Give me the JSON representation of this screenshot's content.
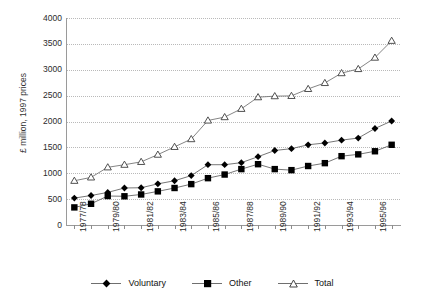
{
  "chart_data": {
    "type": "line",
    "title": "",
    "xlabel": "",
    "ylabel": "£ million, 1997 prices",
    "ylim": [
      0,
      4000
    ],
    "yticks": [
      0,
      500,
      1000,
      1500,
      2000,
      2500,
      3000,
      3500,
      4000
    ],
    "grid": true,
    "legend_position": "bottom",
    "x": [
      "1977/78",
      "1978/79",
      "1979/80",
      "1980/81",
      "1981/82",
      "1982/83",
      "1983/84",
      "1984/85",
      "1985/86",
      "1986/87",
      "1987/88",
      "1988/89",
      "1989/90",
      "1990/91",
      "1991/92",
      "1992/93",
      "1993/94",
      "1994/95",
      "1995/96",
      "1996/97"
    ],
    "categories": [
      "1977/78",
      "1978/79",
      "1979/80",
      "1980/81",
      "1981/82",
      "1982/83",
      "1983/84",
      "1984/85",
      "1985/86",
      "1986/87",
      "1987/88",
      "1988/89",
      "1989/90",
      "1990/91",
      "1991/92",
      "1992/93",
      "1993/94",
      "1994/95",
      "1995/96",
      "1996/97"
    ],
    "xtick_labels_shown": [
      "1977/78",
      "",
      "1979/80",
      "",
      "1981/82",
      "",
      "1983/84",
      "",
      "1985/86",
      "",
      "1987/88",
      "",
      "1989/90",
      "",
      "1991/92",
      "",
      "1993/94",
      "",
      "1995/96",
      ""
    ],
    "series": [
      {
        "name": "Voluntary",
        "marker": "diamond",
        "color": "#000000",
        "values": [
          520,
          570,
          630,
          715,
          720,
          795,
          855,
          955,
          1165,
          1165,
          1205,
          1320,
          1440,
          1475,
          1550,
          1585,
          1640,
          1680,
          1865,
          2010
        ]
      },
      {
        "name": "Other",
        "marker": "square",
        "color": "#000000",
        "values": [
          340,
          410,
          560,
          555,
          590,
          650,
          715,
          790,
          905,
          975,
          1080,
          1175,
          1080,
          1060,
          1140,
          1195,
          1330,
          1365,
          1425,
          1550
        ]
      },
      {
        "name": "Total",
        "marker": "triangle",
        "color": "#555555",
        "values": [
          855,
          920,
          1115,
          1165,
          1220,
          1360,
          1510,
          1660,
          2020,
          2085,
          2245,
          2470,
          2490,
          2495,
          2630,
          2745,
          2935,
          3015,
          3235,
          3560
        ]
      }
    ]
  },
  "legend": {
    "items": [
      {
        "label": "Voluntary",
        "marker": "diamond-marker"
      },
      {
        "label": "Other",
        "marker": "square-marker"
      },
      {
        "label": "Total",
        "marker": "triangle-marker"
      }
    ]
  }
}
